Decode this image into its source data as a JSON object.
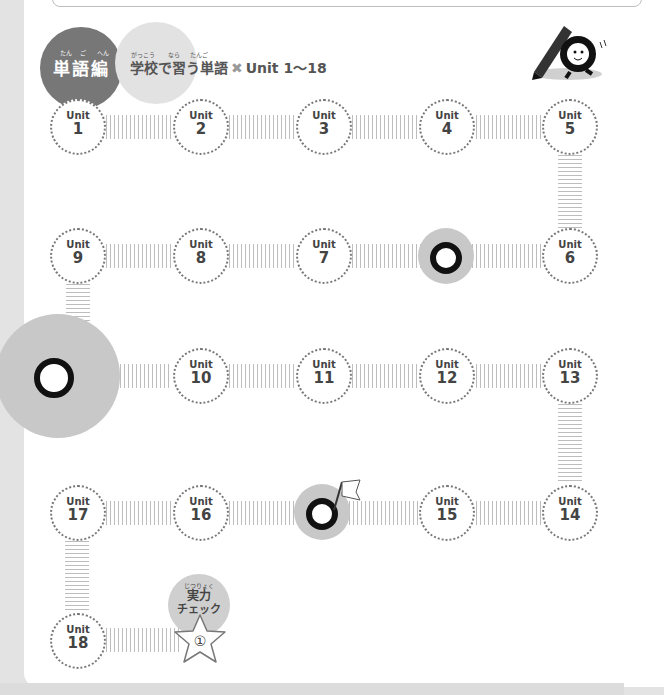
{
  "header": {
    "section_label": "単語編",
    "section_ruby": [
      "たん",
      "ご",
      "へん"
    ],
    "title_main": "学校で習う単語",
    "title_ruby": {
      "gakkou": "がっこう",
      "nara": "なら",
      "tango": "たんご"
    },
    "title_mark": "✖",
    "title_range": "Unit 1～18"
  },
  "units": [
    {
      "label": "Unit",
      "num": "1"
    },
    {
      "label": "Unit",
      "num": "2"
    },
    {
      "label": "Unit",
      "num": "3"
    },
    {
      "label": "Unit",
      "num": "4"
    },
    {
      "label": "Unit",
      "num": "5"
    },
    {
      "label": "Unit",
      "num": "6"
    },
    {
      "label": "Unit",
      "num": "7"
    },
    {
      "label": "Unit",
      "num": "8"
    },
    {
      "label": "Unit",
      "num": "9"
    },
    {
      "label": "Unit",
      "num": "10"
    },
    {
      "label": "Unit",
      "num": "11"
    },
    {
      "label": "Unit",
      "num": "12"
    },
    {
      "label": "Unit",
      "num": "13"
    },
    {
      "label": "Unit",
      "num": "14"
    },
    {
      "label": "Unit",
      "num": "15"
    },
    {
      "label": "Unit",
      "num": "16"
    },
    {
      "label": "Unit",
      "num": "17"
    },
    {
      "label": "Unit",
      "num": "18"
    }
  ],
  "check": {
    "ruby": "じつりょく",
    "line1": "実力",
    "line2": "チェック",
    "badge": "①"
  },
  "icons": [
    "pencil-mascot-icon",
    "confused-mascot-icon",
    "surprised-mascot-icon",
    "flag-mascot-icon",
    "star-icon"
  ]
}
